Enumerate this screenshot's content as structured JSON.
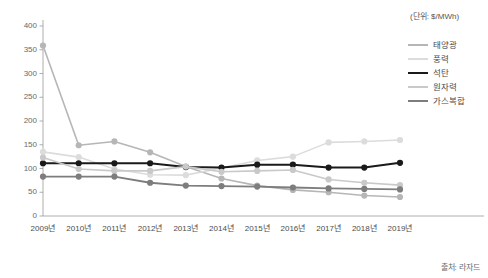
{
  "unit_note": "(단위: $/MWh)",
  "source_note": "출처: 라자드",
  "legend": {
    "items": [
      {
        "label": "태양광",
        "color": "#b6b6b6",
        "width": 1.6
      },
      {
        "label": "풍력",
        "color": "#dcdcdc",
        "width": 1.6
      },
      {
        "label": "석탄",
        "color": "#1a1a1a",
        "width": 2.0
      },
      {
        "label": "원자력",
        "color": "#c9c9c9",
        "width": 1.6
      },
      {
        "label": "가스복합",
        "color": "#7d7d7d",
        "width": 1.8
      }
    ]
  },
  "chart_data": {
    "type": "line",
    "title": "",
    "subtitle": "",
    "xlabel": "",
    "ylabel": "",
    "unit": "$/MWh",
    "grid": false,
    "legend_position": "right",
    "ylim": [
      0,
      400
    ],
    "yticks": [
      0,
      50,
      100,
      150,
      200,
      250,
      300,
      350,
      400
    ],
    "categories": [
      "2009년",
      "2010년",
      "2011년",
      "2012년",
      "2013년",
      "2014년",
      "2015년",
      "2016년",
      "2017년",
      "2018년",
      "2019년"
    ],
    "series": [
      {
        "name": "태양광",
        "color": "#b6b6b6",
        "values": [
          359,
          149,
          157,
          134,
          104,
          79,
          64,
          55,
          50,
          43,
          40
        ]
      },
      {
        "name": "풍력",
        "color": "#dcdcdc",
        "values": [
          135,
          124,
          99,
          87,
          86,
          101,
          117,
          125,
          155,
          157,
          160
        ]
      },
      {
        "name": "석탄",
        "color": "#1a1a1a",
        "values": [
          111,
          111,
          111,
          111,
          103,
          102,
          108,
          108,
          102,
          102,
          112
        ]
      },
      {
        "name": "원자력",
        "color": "#c9c9c9",
        "values": [
          123,
          99,
          95,
          95,
          104,
          93,
          95,
          97,
          77,
          70,
          65
        ]
      },
      {
        "name": "가스복합",
        "color": "#7d7d7d",
        "values": [
          83,
          83,
          83,
          70,
          64,
          63,
          62,
          60,
          58,
          57,
          56
        ]
      }
    ]
  }
}
